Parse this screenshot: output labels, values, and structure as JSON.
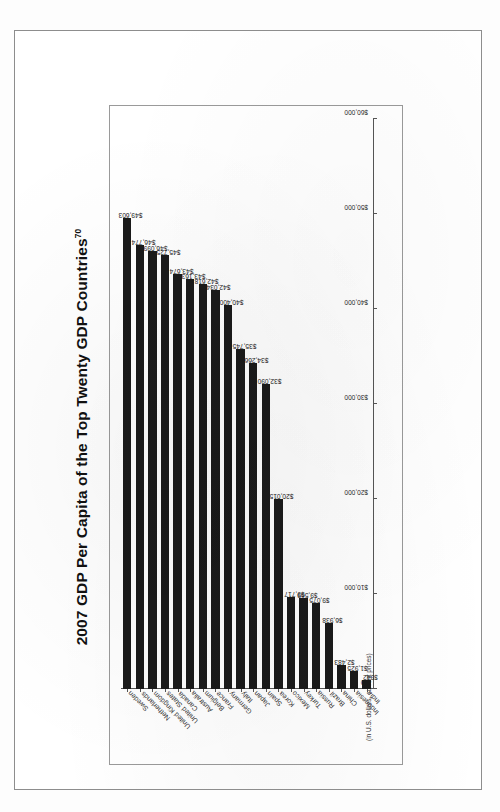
{
  "page": {
    "document_type": "scanned-book-page"
  },
  "chart_data": {
    "type": "bar",
    "orientation": "horizontal",
    "title": "2007 GDP Per Capita of the Top Twenty GDP Countries",
    "title_footnote": "70",
    "subtitle": "(in U.S. dollars, current prices)",
    "xlabel": "",
    "ylabel": "",
    "xlim": [
      0,
      60000
    ],
    "grid": false,
    "legend": "none",
    "tick_labels": [
      "$0",
      "$10,000",
      "$20,000",
      "$30,000",
      "$40,000",
      "$50,000",
      "$60,000"
    ],
    "tick_values": [
      0,
      10000,
      20000,
      30000,
      40000,
      50000,
      60000
    ],
    "categories": [
      "Sweden",
      "Netherlands",
      "United Kingdom",
      "United States",
      "Canada",
      "Australia",
      "Belgium",
      "France",
      "Germany",
      "Italy",
      "Japan",
      "Spain",
      "Korea",
      "Mexico",
      "Turkey",
      "Russia",
      "Brazil",
      "China",
      "Indonesia",
      "India"
    ],
    "values": [
      49603,
      46774,
      46099,
      45725,
      43674,
      43163,
      42618,
      42034,
      40400,
      35745,
      34266,
      32090,
      20015,
      9717,
      9569,
      9075,
      6938,
      2483,
      1925,
      942
    ],
    "value_labels": [
      "$49,603",
      "$46,774",
      "$46,099",
      "$45,725",
      "$43,674",
      "$43,163",
      "$42,618",
      "$42,034",
      "$40,400",
      "$35,745",
      "$34,266",
      "$32,090",
      "$20,015",
      "$9,717",
      "$9,569",
      "$9,075",
      "$6,938",
      "$2,483",
      "$1,925",
      "$942"
    ],
    "bar_color": "#1a1a1a"
  }
}
